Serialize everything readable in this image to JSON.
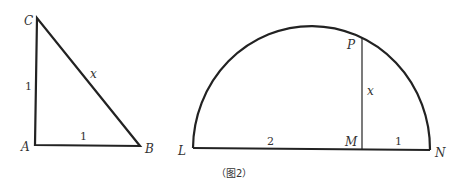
{
  "figure1": {
    "vertices": {
      "A": "A",
      "B": "B",
      "C": "C"
    },
    "sides": {
      "AC": "1",
      "AB": "1",
      "BC": "x"
    }
  },
  "figure2": {
    "points": {
      "L": "L",
      "M": "M",
      "N": "N",
      "P": "P"
    },
    "segments": {
      "LM": "2",
      "MN": "1",
      "PM": "x"
    },
    "caption": "（图2）"
  }
}
